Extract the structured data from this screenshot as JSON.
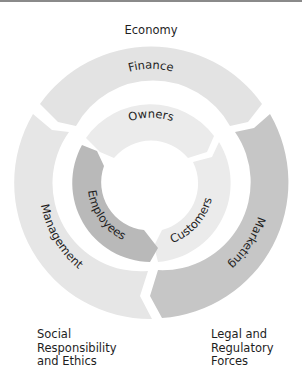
{
  "diagram": {
    "environment_labels": {
      "top": "Economy",
      "bottom_left": [
        "Social",
        "Responsibility",
        "and Ethics"
      ],
      "bottom_right": [
        "Legal and",
        "Regulatory",
        "Forces"
      ]
    },
    "outer_ring": [
      {
        "id": "finance",
        "label": "Finance",
        "color": "#e3e3e3"
      },
      {
        "id": "marketing",
        "label": "Marketing",
        "color": "#c6c6c6"
      },
      {
        "id": "management",
        "label": "Management",
        "color": "#e6e6e6"
      }
    ],
    "inner_ring": [
      {
        "id": "owners",
        "label": "Owners",
        "color": "#ebebeb"
      },
      {
        "id": "customers",
        "label": "Customers",
        "color": "#ebebeb"
      },
      {
        "id": "employees",
        "label": "Employees",
        "color": "#b9b9b9"
      }
    ],
    "colors": {
      "background": "#ffffff",
      "top_rule": "#8a8a8a",
      "text": "#1e1e1e"
    }
  }
}
